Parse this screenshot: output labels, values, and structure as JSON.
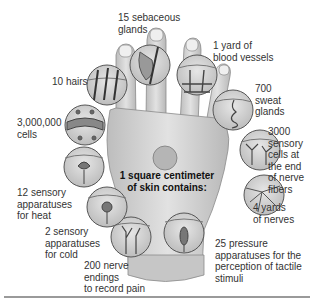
{
  "diagram": {
    "title": "1 square centimeter of skin contains:",
    "title_lines": [
      "1 square centimeter",
      "of skin contains:"
    ],
    "colors": {
      "skin": "#cfcfcf",
      "skin_shadow": "#a9a9a9",
      "circle_fill": "#d9d9d9",
      "circle_stroke": "#555555",
      "center_spot": "#b5b5b5"
    },
    "callouts": [
      {
        "id": "sebaceous",
        "lines": [
          "15 sebaceous",
          "glands"
        ]
      },
      {
        "id": "blood-vessels",
        "lines": [
          "1 yard of",
          "blood vessels"
        ]
      },
      {
        "id": "hairs",
        "lines": [
          "10 hairs"
        ]
      },
      {
        "id": "sweat-glands",
        "lines": [
          "700",
          "sweat",
          "glands"
        ]
      },
      {
        "id": "cells",
        "lines": [
          "3,000,000",
          "cells"
        ]
      },
      {
        "id": "sensory-cells",
        "lines": [
          "3000",
          "sensory",
          "cells at",
          "the end",
          "of nerve",
          "fibers"
        ]
      },
      {
        "id": "heat",
        "lines": [
          "12 sensory",
          "apparatuses",
          "for heat"
        ]
      },
      {
        "id": "nerves",
        "lines": [
          "4 yards",
          "of nerves"
        ]
      },
      {
        "id": "cold",
        "lines": [
          "2 sensory",
          "apparatuses",
          "for cold"
        ]
      },
      {
        "id": "pressure",
        "lines": [
          "25 pressure",
          "apparatuses for the",
          "perception of tactile",
          "stimuli"
        ]
      },
      {
        "id": "pain",
        "lines": [
          "200 nerve",
          "endings",
          "to record pain"
        ]
      }
    ]
  }
}
